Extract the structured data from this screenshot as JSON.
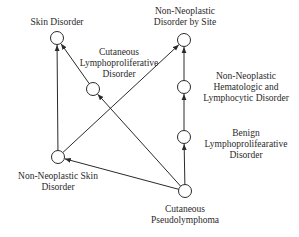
{
  "diagram": {
    "type": "directed-graph",
    "colors": {
      "edge": "#2a2a2a",
      "node_fill": "#ffffff",
      "node_stroke": "#2a2a2a",
      "text": "#2a2a2a",
      "background": "#ffffff"
    },
    "nodes": [
      {
        "id": "skin",
        "label_lines": [
          "Skin Disorder"
        ],
        "cx": 57,
        "cy": 38
      },
      {
        "id": "cld",
        "label_lines": [
          "Cutaneous",
          "Lymphoproliferative",
          "Disorder"
        ],
        "cx": 93,
        "cy": 89
      },
      {
        "id": "nnsite",
        "label_lines": [
          "Non-Neoplastic",
          "Disorder by Site"
        ],
        "cx": 184,
        "cy": 40
      },
      {
        "id": "nnheme",
        "label_lines": [
          "Non-Neoplastic",
          "Hematologic and",
          "Lymphocytic Disorder"
        ],
        "cx": 184,
        "cy": 87
      },
      {
        "id": "benign",
        "label_lines": [
          "Benign",
          "Lymphoprolifearative",
          "Disorder"
        ],
        "cx": 184,
        "cy": 137
      },
      {
        "id": "nnskin",
        "label_lines": [
          "Non-Neoplastic Skin",
          "Disorder"
        ],
        "cx": 58,
        "cy": 157
      },
      {
        "id": "pseudo",
        "label_lines": [
          "Cutaneous",
          "Pseudolymphoma"
        ],
        "cx": 185,
        "cy": 191
      }
    ],
    "edges": [
      {
        "from": "nnskin",
        "to": "skin"
      },
      {
        "from": "cld",
        "to": "skin"
      },
      {
        "from": "nnskin",
        "to": "nnsite"
      },
      {
        "from": "nnheme",
        "to": "nnsite"
      },
      {
        "from": "benign",
        "to": "nnheme"
      },
      {
        "from": "pseudo",
        "to": "benign"
      },
      {
        "from": "pseudo",
        "to": "cld"
      },
      {
        "from": "pseudo",
        "to": "nnskin"
      }
    ]
  },
  "labels": {
    "skin": [
      "Skin Disorder"
    ],
    "cld": [
      "Cutaneous",
      "Lymphoproliferative",
      "Disorder"
    ],
    "nnsite": [
      "Non-Neoplastic",
      "Disorder by Site"
    ],
    "nnheme": [
      "Non-Neoplastic",
      "Hematologic and",
      "Lymphocytic Disorder"
    ],
    "benign": [
      "Benign",
      "Lymphoprolifearative",
      "Disorder"
    ],
    "nnskin": [
      "Non-Neoplastic Skin",
      "Disorder"
    ],
    "pseudo": [
      "Cutaneous",
      "Pseudolymphoma"
    ]
  }
}
